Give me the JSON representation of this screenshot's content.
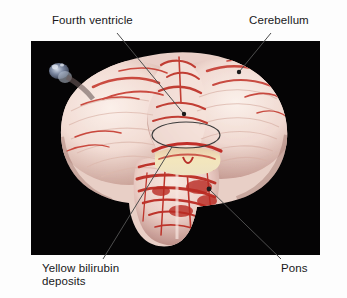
{
  "figure": {
    "kind": "anatomical-photograph",
    "background_color": "#ffffff",
    "photo": {
      "background_color": "#050405",
      "left": 31,
      "top": 41,
      "width": 289,
      "height": 214,
      "tissue_colors": {
        "pale_tissue": "#f0dcd6",
        "highlight_tissue": "#faeee8",
        "red_vessel": "#c8352c",
        "deep_red": "#9e231d",
        "yellow_bilirubin": "#efe0ae",
        "shadow": "#b08a82",
        "blue_structure": "#5a6a86"
      }
    },
    "annotation_color": "#4d4d4d"
  },
  "labels": [
    {
      "id": "fourth-ventricle",
      "text": "Fourth ventricle",
      "lines": [
        "Fourth ventricle"
      ],
      "position": "top-left",
      "leader": {
        "from_x": 117,
        "from_y": 33,
        "to_x": 184,
        "to_y": 114,
        "marker": "dot"
      }
    },
    {
      "id": "cerebellum",
      "text": "Cerebellum",
      "lines": [
        "Cerebellum"
      ],
      "position": "top-right",
      "leader": {
        "from_x": 271,
        "from_y": 33,
        "to_x": 239,
        "to_y": 72,
        "marker": "dot"
      }
    },
    {
      "id": "yellow-bilirubin-deposits",
      "text": "Yellow bilirubin deposits",
      "lines": [
        "Yellow bilirubin",
        "deposits"
      ],
      "position": "bottom-left",
      "leader": {
        "from_x": 103,
        "from_y": 259,
        "to_x": 172,
        "to_y": 147,
        "marker": "ellipse"
      }
    },
    {
      "id": "pons",
      "text": "Pons",
      "lines": [
        "Pons"
      ],
      "position": "bottom-right",
      "leader": {
        "from_x": 281,
        "from_y": 259,
        "to_x": 209,
        "to_y": 189,
        "marker": "dot"
      }
    }
  ],
  "callout_ellipse": {
    "center_x": 186,
    "center_y": 135,
    "radius_x": 34,
    "radius_y": 13,
    "stroke": "#3c3c3c",
    "encircles": "yellow-bilirubin-deposits"
  }
}
